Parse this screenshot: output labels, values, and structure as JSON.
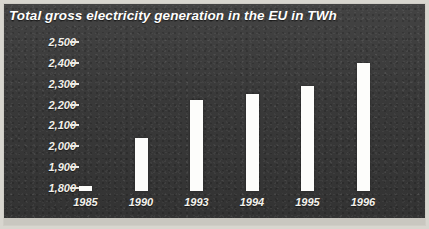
{
  "chart_data": {
    "type": "bar",
    "title": "Total gross electricity generation in the EU in TWh",
    "xlabel": "",
    "ylabel": "",
    "categories": [
      "1985",
      "1990",
      "1993",
      "1994",
      "1995",
      "1996"
    ],
    "values": [
      1810,
      2040,
      2220,
      2250,
      2290,
      2400
    ],
    "ylim": [
      1800,
      2500
    ],
    "ytick_labels": [
      "2,500",
      "2,400",
      "2,300",
      "2,200",
      "2,100",
      "2,000",
      "1,900",
      "1,800"
    ],
    "ytick_values": [
      2500,
      2400,
      2300,
      2200,
      2100,
      2000,
      1900,
      1800
    ],
    "grid": false,
    "legend": null,
    "series": [
      {
        "name": "Total gross electricity generation",
        "values": [
          1810,
          2040,
          2220,
          2250,
          2290,
          2400
        ]
      }
    ],
    "colors": {
      "bar": "#fdfdfb",
      "background": "#3a3a3a",
      "text": "#ffffff",
      "frame": "#d8d6cf"
    }
  }
}
